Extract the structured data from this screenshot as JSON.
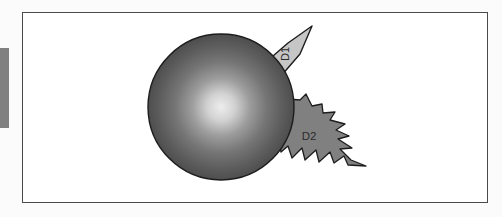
{
  "canvas": {
    "background_color": "#ffffff",
    "border_color": "#4a4a4a",
    "outer_background_color": "#fbfbfb"
  },
  "left_bar": {
    "name": "left-edge-bar",
    "color": "#808080"
  },
  "shapes": {
    "sphere": {
      "name": "gradient-sphere",
      "label": "",
      "center_color": "#e8e8e8",
      "edge_color": "#4f4f4f",
      "outline_color": "#1c1c1c",
      "cx": 221,
      "cy": 107,
      "r": 73
    },
    "arrow": {
      "name": "arrow-callout",
      "label": "D1",
      "fill_color": "#c6c6c6",
      "outline_color": "#1c1c1c",
      "label_rotation": -90
    },
    "burst": {
      "name": "jagged-burst",
      "label": "D2",
      "fill_color": "#808080",
      "outline_color": "#1c1c1c",
      "label_rotation": 0
    }
  }
}
